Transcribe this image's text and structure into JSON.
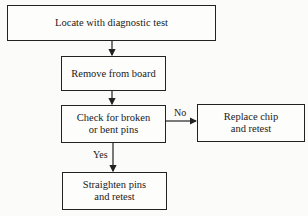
{
  "diagram": {
    "type": "flowchart",
    "nodes": [
      {
        "id": "locate",
        "label": "Locate with diagnostic test"
      },
      {
        "id": "remove",
        "label": "Remove from board"
      },
      {
        "id": "check",
        "label": "Check for broken or bent pins",
        "label_lines": [
          "Check for broken",
          "or bent pins"
        ]
      },
      {
        "id": "replace",
        "label": "Replace chip and retest",
        "label_lines": [
          "Replace chip",
          "and retest"
        ]
      },
      {
        "id": "straighten",
        "label": "Straighten pins and retest",
        "label_lines": [
          "Straighten pins",
          "and retest"
        ]
      }
    ],
    "edges": [
      {
        "from": "locate",
        "to": "remove",
        "label": ""
      },
      {
        "from": "remove",
        "to": "check",
        "label": ""
      },
      {
        "from": "check",
        "to": "replace",
        "label": "No"
      },
      {
        "from": "check",
        "to": "straighten",
        "label": "Yes"
      }
    ],
    "edge_labels": {
      "no": "No",
      "yes": "Yes"
    }
  }
}
